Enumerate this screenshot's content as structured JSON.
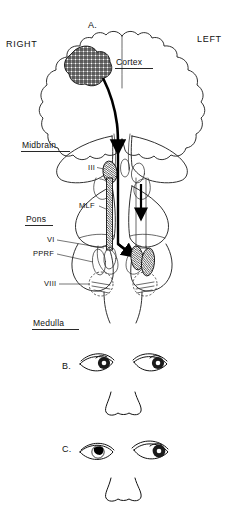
{
  "figure": {
    "title_hidden": "",
    "orientation": {
      "right_label": "RIGHT",
      "left_label": "LEFT"
    },
    "panels": [
      {
        "id": "A",
        "label": "A.",
        "description": "Brainstem and cerebral hemispheres schematic with lesion"
      },
      {
        "id": "B",
        "label": "B.",
        "description": "Face showing conjugate eye deviation"
      },
      {
        "id": "C",
        "label": "C.",
        "description": "Face showing internuclear ophthalmoplegia pattern"
      }
    ],
    "anatomy_labels": [
      {
        "name": "cortex",
        "text": "Cortex",
        "underlined": true
      },
      {
        "name": "midbrain",
        "text": "Midbrain",
        "underlined": true
      },
      {
        "name": "pons",
        "text": "Pons",
        "underlined": true
      },
      {
        "name": "medulla",
        "text": "Medulla",
        "underlined": true
      }
    ],
    "nuclei_labels": [
      {
        "name": "oculomotor-nucleus",
        "text": "III"
      },
      {
        "name": "medial-longitudinal-fasciculus",
        "text": "MLF"
      },
      {
        "name": "abducens-nucleus",
        "text": "VI"
      },
      {
        "name": "paramedian-pontine-reticular-formation",
        "text": "PPRF"
      },
      {
        "name": "vestibular-nucleus",
        "text": "VIII"
      }
    ],
    "eye_panels": {
      "B": {
        "right_eye": {
          "gaze": "adducted",
          "iris_shade": "dark",
          "iris_offset": 0.62
        },
        "left_eye": {
          "gaze": "abducted",
          "iris_shade": "dark",
          "iris_offset": 0.66
        }
      },
      "C": {
        "right_eye": {
          "gaze": "midline",
          "iris_shade": "light",
          "iris_offset": 0.48
        },
        "left_eye": {
          "gaze": "abducted",
          "iris_shade": "dark",
          "iris_offset": 0.68
        }
      }
    },
    "colors": {
      "ink": "#101010",
      "outline": "#1a1a1a",
      "background": "#ffffff",
      "shaded_nucleus": "#555555"
    }
  }
}
